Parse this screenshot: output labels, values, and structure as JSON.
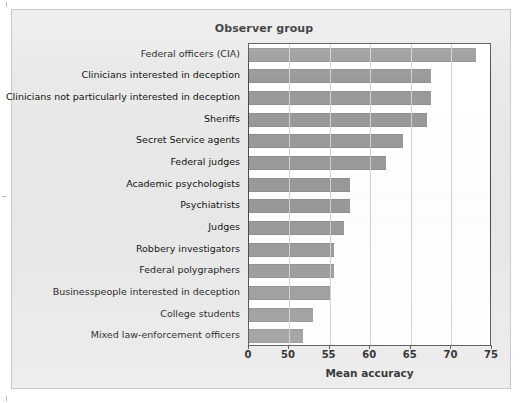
{
  "figure": {
    "title": "Observer group",
    "xlabel": "Mean accuracy"
  },
  "chart_data": {
    "type": "bar",
    "orientation": "horizontal",
    "title": "Observer group",
    "xlabel": "Mean accuracy",
    "ylabel": "",
    "xlim": [
      0,
      75
    ],
    "axis_break": true,
    "axis_note": "x-axis is broken: 0 then 50 to 75 in steps of 5",
    "ticks": [
      0,
      50,
      55,
      60,
      65,
      70,
      75
    ],
    "grid": "vertical",
    "legend": "none",
    "bar_color": "#9a9a9a",
    "categories": [
      "Federal officers (CIA)",
      "Clinicians interested in deception",
      "Clinicians not particularly interested in deception",
      "Sheriffs",
      "Secret Service agents",
      "Federal judges",
      "Academic psychologists",
      "Psychiatrists",
      "Judges",
      "Robbery investigators",
      "Federal polygraphers",
      "Businesspeople interested in deception",
      "College students",
      "Mixed law-enforcement officers"
    ],
    "values": [
      73.0,
      67.5,
      67.5,
      67.0,
      64.0,
      62.0,
      57.5,
      57.5,
      56.8,
      55.5,
      55.5,
      55.2,
      52.9,
      51.7
    ]
  }
}
